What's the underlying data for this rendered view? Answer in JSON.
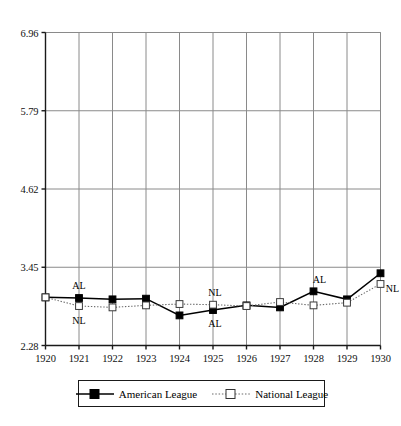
{
  "chart_data": {
    "type": "line",
    "title": "",
    "subtitle": "",
    "xlabel": "",
    "ylabel": "",
    "categories": [
      1920,
      1921,
      1922,
      1923,
      1924,
      1925,
      1926,
      1927,
      1928,
      1929,
      1930
    ],
    "x": [
      1920,
      1921,
      1922,
      1923,
      1924,
      1925,
      1926,
      1927,
      1928,
      1929,
      1930
    ],
    "xlim": [
      1920,
      1930
    ],
    "ylim": [
      2.28,
      6.96
    ],
    "yticks": [
      "2.28",
      "3.45",
      "4.62",
      "5.79",
      "6.96"
    ],
    "ytick_values": [
      2.28,
      3.45,
      4.62,
      5.79,
      6.96
    ],
    "xticks": [
      "1920",
      "1921",
      "1922",
      "1923",
      "1924",
      "1925",
      "1926",
      "1927",
      "1928",
      "1929",
      "1930"
    ],
    "grid": true,
    "grid_axis": "both",
    "legend_position": "bottom",
    "series": [
      {
        "name": "American League",
        "marker": "filled-square",
        "line_style": "solid",
        "color": "#000000",
        "values": [
          3.0,
          2.99,
          2.97,
          2.98,
          2.73,
          2.81,
          2.88,
          2.85,
          3.09,
          2.97,
          3.36
        ]
      },
      {
        "name": "National League",
        "marker": "open-square",
        "line_style": "dotted",
        "color": "#555555",
        "values": [
          3.0,
          2.87,
          2.85,
          2.88,
          2.9,
          2.89,
          2.87,
          2.93,
          2.88,
          2.92,
          3.2
        ]
      }
    ],
    "annotations": [
      {
        "text": "AL",
        "x": 1921,
        "y": 2.99,
        "position": "above",
        "dx": 0,
        "dy": -13
      },
      {
        "text": "NL",
        "x": 1921,
        "y": 2.87,
        "position": "below",
        "dx": 0,
        "dy": 14
      },
      {
        "text": "NL",
        "x": 1925,
        "y": 2.89,
        "position": "above",
        "dx": 2,
        "dy": -13
      },
      {
        "text": "AL",
        "x": 1925,
        "y": 2.81,
        "position": "below",
        "dx": 2,
        "dy": 13
      },
      {
        "text": "AL",
        "x": 1928,
        "y": 3.09,
        "position": "above",
        "dx": 6,
        "dy": -12
      },
      {
        "text": "NL",
        "x": 1930,
        "y": 3.2,
        "position": "right",
        "dx": 12,
        "dy": 4
      }
    ]
  },
  "legend": {
    "entries": [
      {
        "label": "American League",
        "marker": "filled-square",
        "line_style": "solid"
      },
      {
        "label": "National League",
        "marker": "open-square",
        "line_style": "dotted"
      }
    ]
  },
  "colors": {
    "axis": "#1a1a1a",
    "grid": "#8a8a8a",
    "american_league": "#000000",
    "national_league": "#6a6a6a",
    "background": "#ffffff"
  }
}
